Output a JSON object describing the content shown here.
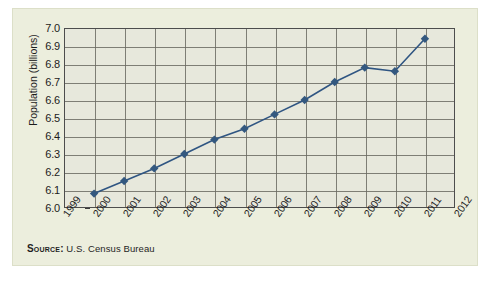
{
  "figure": {
    "source_label": "Source:",
    "source_value": "U.S. Census Bureau",
    "colors": {
      "card_background": "#eceedd",
      "plot_background": "#e7e8dc",
      "grid": "#6b6b63",
      "axis": "#4d4d4d",
      "series": "#2f5582",
      "marker": "#33587f",
      "text": "#1c1c1c"
    }
  },
  "chart_data": {
    "type": "line",
    "title": "",
    "xlabel": "",
    "ylabel": "Population (billions)",
    "x": [
      2000,
      2001,
      2002,
      2003,
      2004,
      2005,
      2006,
      2007,
      2008,
      2009,
      2010,
      2011
    ],
    "values": [
      6.08,
      6.15,
      6.22,
      6.3,
      6.38,
      6.44,
      6.52,
      6.6,
      6.7,
      6.78,
      6.76,
      6.94
    ],
    "series": [
      {
        "name": "World population",
        "values": [
          6.08,
          6.15,
          6.22,
          6.3,
          6.38,
          6.44,
          6.52,
          6.6,
          6.7,
          6.78,
          6.76,
          6.94
        ]
      }
    ],
    "x_ticks": [
      "1999",
      "2000",
      "2001",
      "2002",
      "2003",
      "2004",
      "2005",
      "2006",
      "2007",
      "2008",
      "2009",
      "2010",
      "2011",
      "2012"
    ],
    "y_ticks": [
      "6.0",
      "6.1",
      "6.2",
      "6.3",
      "6.4",
      "6.5",
      "6.6",
      "6.7",
      "6.8",
      "6.9",
      "7.0"
    ],
    "xlim": [
      1999,
      2012
    ],
    "ylim": [
      6.0,
      7.0
    ],
    "grid": true,
    "legend": "none",
    "marker": "diamond"
  }
}
